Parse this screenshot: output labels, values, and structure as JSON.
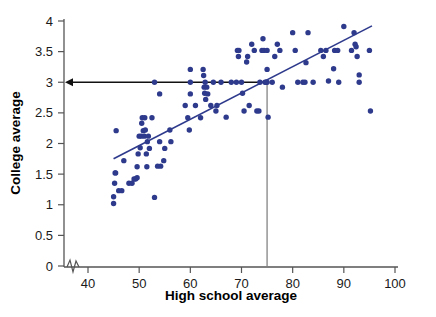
{
  "chart_data": {
    "type": "scatter",
    "title": "",
    "xlabel": "High school average",
    "ylabel": "College average",
    "xlim": [
      36,
      101
    ],
    "ylim": [
      0,
      4
    ],
    "xticks": [
      40,
      50,
      60,
      70,
      80,
      90,
      100
    ],
    "xtick_labels": [
      "40",
      "50",
      "60",
      "70",
      "80",
      "90",
      "100"
    ],
    "yticks": [
      0,
      0.5,
      1,
      1.5,
      2,
      2.5,
      3,
      3.5,
      4
    ],
    "ytick_labels": [
      "0",
      "0.5",
      "1",
      "1.5",
      "2",
      "2.5",
      "3",
      "3.5",
      "4"
    ],
    "grid": false,
    "legend": null,
    "axis_break": true,
    "dot_color": "#2e3a8c",
    "line_color": "#2e3a8c",
    "annotation_color": "#111111",
    "reference_vline_color": "#8c8c8c",
    "regression_line": {
      "label": "least-squares line",
      "x_start": 45.0,
      "y_start": 1.75,
      "x_end": 95.5,
      "y_end": 3.92
    },
    "annotations": [
      {
        "name": "prediction-vline",
        "type": "vline",
        "x": 75,
        "y_from": 0,
        "y_to": 3.0
      },
      {
        "name": "prediction-arrow",
        "type": "arrow",
        "y": 3.0,
        "x_from": 75,
        "x_to": 36,
        "direction": "left"
      }
    ],
    "points": [
      [
        45.0,
        1.02
      ],
      [
        45.0,
        1.13
      ],
      [
        45.2,
        1.35
      ],
      [
        45.3,
        1.52
      ],
      [
        45.4,
        1.52
      ],
      [
        45.5,
        2.21
      ],
      [
        46.0,
        1.23
      ],
      [
        46.6,
        1.23
      ],
      [
        47.0,
        1.72
      ],
      [
        48.0,
        1.35
      ],
      [
        48.6,
        1.35
      ],
      [
        49.0,
        1.42
      ],
      [
        49.3,
        1.42
      ],
      [
        49.6,
        1.44
      ],
      [
        49.6,
        1.62
      ],
      [
        49.8,
        1.83
      ],
      [
        50.0,
        2.12
      ],
      [
        50.2,
        1.93
      ],
      [
        50.4,
        2.12
      ],
      [
        50.5,
        2.33
      ],
      [
        50.6,
        2.42
      ],
      [
        50.8,
        2.21
      ],
      [
        51.0,
        2.12
      ],
      [
        51.1,
        2.42
      ],
      [
        51.2,
        2.22
      ],
      [
        51.4,
        1.83
      ],
      [
        51.5,
        1.62
      ],
      [
        51.6,
        2.03
      ],
      [
        51.8,
        2.12
      ],
      [
        52.0,
        1.92
      ],
      [
        52.5,
        2.42
      ],
      [
        53.0,
        1.12
      ],
      [
        53.0,
        3.0
      ],
      [
        53.6,
        1.63
      ],
      [
        54.0,
        2.03
      ],
      [
        54.2,
        1.63
      ],
      [
        54.0,
        2.81
      ],
      [
        54.8,
        1.72
      ],
      [
        55.0,
        1.92
      ],
      [
        56.0,
        2.22
      ],
      [
        56.2,
        2.03
      ],
      [
        59.0,
        2.62
      ],
      [
        59.5,
        2.42
      ],
      [
        59.8,
        2.22
      ],
      [
        60.0,
        3.21
      ],
      [
        60.0,
        2.81
      ],
      [
        60.0,
        3.0
      ],
      [
        61.0,
        2.62
      ],
      [
        62.0,
        2.42
      ],
      [
        62.5,
        3.21
      ],
      [
        62.6,
        3.11
      ],
      [
        62.7,
        2.92
      ],
      [
        62.8,
        2.82
      ],
      [
        62.9,
        3.0
      ],
      [
        63.0,
        2.72
      ],
      [
        63.2,
        2.92
      ],
      [
        63.4,
        2.81
      ],
      [
        64.0,
        2.62
      ],
      [
        64.5,
        3.0
      ],
      [
        65.0,
        2.53
      ],
      [
        65.2,
        2.62
      ],
      [
        66.0,
        3.0
      ],
      [
        67.0,
        2.43
      ],
      [
        68.0,
        3.0
      ],
      [
        69.0,
        3.0
      ],
      [
        69.2,
        3.52
      ],
      [
        69.4,
        3.42
      ],
      [
        69.5,
        3.52
      ],
      [
        70.0,
        3.0
      ],
      [
        70.2,
        2.82
      ],
      [
        70.5,
        2.53
      ],
      [
        71.0,
        3.33
      ],
      [
        71.2,
        3.42
      ],
      [
        71.5,
        2.62
      ],
      [
        72.0,
        3.62
      ],
      [
        72.5,
        3.52
      ],
      [
        73.0,
        2.53
      ],
      [
        73.4,
        2.53
      ],
      [
        73.6,
        3.0
      ],
      [
        74.0,
        3.52
      ],
      [
        74.2,
        3.71
      ],
      [
        74.4,
        3.52
      ],
      [
        74.6,
        3.0
      ],
      [
        74.8,
        3.0
      ],
      [
        75.0,
        3.21
      ],
      [
        75.0,
        3.52
      ],
      [
        75.0,
        3.0
      ],
      [
        75.2,
        2.43
      ],
      [
        76.0,
        3.0
      ],
      [
        76.5,
        3.42
      ],
      [
        77.0,
        3.62
      ],
      [
        77.5,
        3.52
      ],
      [
        78.0,
        2.92
      ],
      [
        80.0,
        3.81
      ],
      [
        80.5,
        3.52
      ],
      [
        81.0,
        3.0
      ],
      [
        82.0,
        3.0
      ],
      [
        82.4,
        3.0
      ],
      [
        82.6,
        3.32
      ],
      [
        83.0,
        3.81
      ],
      [
        84.0,
        3.0
      ],
      [
        85.5,
        3.52
      ],
      [
        86.0,
        3.42
      ],
      [
        86.5,
        3.52
      ],
      [
        87.0,
        3.02
      ],
      [
        88.0,
        3.22
      ],
      [
        88.2,
        3.52
      ],
      [
        88.8,
        3.52
      ],
      [
        89.0,
        3.0
      ],
      [
        90.0,
        3.91
      ],
      [
        91.5,
        3.52
      ],
      [
        92.0,
        3.81
      ],
      [
        92.2,
        3.62
      ],
      [
        92.4,
        3.58
      ],
      [
        92.6,
        3.42
      ],
      [
        93.0,
        3.12
      ],
      [
        93.0,
        3.0
      ],
      [
        95.0,
        3.52
      ],
      [
        95.2,
        2.53
      ]
    ]
  }
}
